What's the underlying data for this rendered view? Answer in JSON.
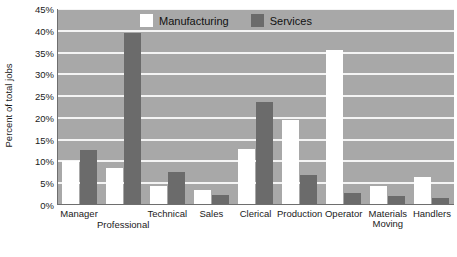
{
  "chart_data": {
    "type": "bar",
    "title": "",
    "xlabel": "",
    "ylabel": "Percent of total jobs",
    "ylim": [
      0,
      45
    ],
    "ytick_labels": [
      "45%",
      "40%",
      "35%",
      "30%",
      "25%",
      "20%",
      "15%",
      "10%",
      "5%",
      "0%"
    ],
    "ytick_values": [
      45,
      40,
      35,
      30,
      25,
      20,
      15,
      10,
      5,
      0
    ],
    "grid": true,
    "legend_position": "top-center",
    "categories": [
      "Manager",
      "Professional",
      "Technical",
      "Sales",
      "Clerical",
      "Production",
      "Operator",
      "Materials Moving",
      "Handlers"
    ],
    "series": [
      {
        "name": "Manufacturing",
        "color": "#ffffff",
        "values": [
          10.2,
          8.5,
          4.3,
          3.4,
          12.8,
          19.6,
          35.6,
          4.4,
          6.5
        ]
      },
      {
        "name": "Services",
        "color": "#6b6b6b",
        "values": [
          12.7,
          39.6,
          7.5,
          2.2,
          23.7,
          6.8,
          2.7,
          2.0,
          1.5
        ]
      }
    ]
  },
  "legend": {
    "items": [
      {
        "label": "Manufacturing",
        "swatch": "manufacturing"
      },
      {
        "label": "Services",
        "swatch": "services"
      }
    ]
  },
  "colors": {
    "plot_background": "#a8a8a8",
    "gridline": "#f4f4f4",
    "manufacturing": "#ffffff",
    "services": "#6b6b6b",
    "axis": "#6e6e6e",
    "text": "#1a1a1a"
  }
}
